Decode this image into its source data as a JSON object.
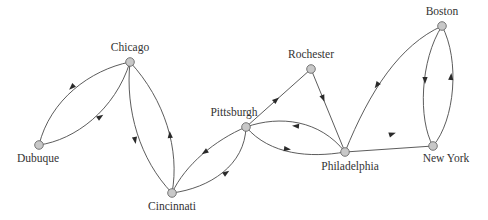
{
  "diagram": {
    "type": "directed-graph",
    "colors": {
      "edge": "#4a4a4a",
      "node_fill": "#c8c8c8",
      "node_stroke": "#6a6a6a",
      "label": "#333333",
      "background": "#ffffff"
    },
    "nodes": [
      {
        "id": "chicago",
        "label": "Chicago",
        "x": 130,
        "y": 62,
        "label_x": 130,
        "label_y": 51,
        "anchor": "middle"
      },
      {
        "id": "dubuque",
        "label": "Dubuque",
        "x": 39,
        "y": 145,
        "label_x": 38,
        "label_y": 162,
        "anchor": "middle"
      },
      {
        "id": "cincinnati",
        "label": "Cincinnati",
        "x": 172,
        "y": 193,
        "label_x": 172,
        "label_y": 210,
        "anchor": "middle"
      },
      {
        "id": "pittsburgh",
        "label": "Pittsburgh",
        "x": 246,
        "y": 127,
        "label_x": 234,
        "label_y": 116,
        "anchor": "middle"
      },
      {
        "id": "rochester",
        "label": "Rochester",
        "x": 311,
        "y": 69,
        "label_x": 311,
        "label_y": 58,
        "anchor": "middle"
      },
      {
        "id": "philadelphia",
        "label": "Philadelphia",
        "x": 345,
        "y": 152,
        "label_x": 350,
        "label_y": 170,
        "anchor": "middle"
      },
      {
        "id": "newyork",
        "label": "New York",
        "x": 433,
        "y": 146,
        "label_x": 446,
        "label_y": 162,
        "anchor": "middle"
      },
      {
        "id": "boston",
        "label": "Boston",
        "x": 442,
        "y": 26,
        "label_x": 442,
        "label_y": 15,
        "anchor": "middle"
      }
    ],
    "edges": [
      {
        "from": "Chicago",
        "to": "Dubuque",
        "path": "M130,62 C90,70 50,100 39,145",
        "arrow": {
          "x": 72,
          "y": 87,
          "angle": 135
        }
      },
      {
        "from": "Dubuque",
        "to": "Chicago",
        "path": "M39,145 C75,140 115,110 130,62",
        "arrow": {
          "x": 100,
          "y": 117,
          "angle": -35
        }
      },
      {
        "from": "Chicago",
        "to": "Cincinnati",
        "path": "M130,62 C125,110 140,160 172,193",
        "arrow": {
          "x": 135,
          "y": 140,
          "angle": 80
        }
      },
      {
        "from": "Cincinnati",
        "to": "Chicago",
        "path": "M172,193 C180,150 165,100 130,62",
        "arrow": {
          "x": 170,
          "y": 135,
          "angle": -95
        }
      },
      {
        "from": "Pittsburgh",
        "to": "Cincinnati",
        "path": "M246,127 C215,140 185,165 172,193",
        "arrow": {
          "x": 205,
          "y": 152,
          "angle": 145
        }
      },
      {
        "from": "Cincinnati",
        "to": "Pittsburgh",
        "path": "M172,193 C210,188 245,165 246,127",
        "arrow": {
          "x": 226,
          "y": 173,
          "angle": -35
        }
      },
      {
        "from": "Pittsburgh",
        "to": "Rochester",
        "path": "M246,127 L311,69",
        "arrow": {
          "x": 276,
          "y": 100,
          "angle": -41
        }
      },
      {
        "from": "Rochester",
        "to": "Philadelphia",
        "path": "M311,69 L345,152",
        "arrow": {
          "x": 323,
          "y": 98,
          "angle": 68
        }
      },
      {
        "from": "Philadelphia",
        "to": "Pittsburgh",
        "path": "M345,152 C320,120 280,115 246,127",
        "arrow": {
          "x": 296,
          "y": 126,
          "angle": 185
        }
      },
      {
        "from": "Pittsburgh",
        "to": "Philadelphia",
        "path": "M246,127 C270,155 310,158 345,152",
        "arrow": {
          "x": 287,
          "y": 149,
          "angle": 8
        }
      },
      {
        "from": "Boston",
        "to": "Philadelphia",
        "path": "M442,26 C400,45 370,90 345,152",
        "arrow": {
          "x": 377,
          "y": 85,
          "angle": 125
        }
      },
      {
        "from": "Philadelphia",
        "to": "NewYork",
        "path": "M345,152 L433,146",
        "arrow": {
          "x": 392,
          "y": 134,
          "angle": -18
        }
      },
      {
        "from": "Boston",
        "to": "NewYork",
        "path": "M442,26 C420,60 418,120 433,146",
        "arrow": {
          "x": 425,
          "y": 80,
          "angle": 90
        }
      },
      {
        "from": "NewYork",
        "to": "Boston",
        "path": "M433,146 C455,120 460,60 442,26",
        "arrow": {
          "x": 451,
          "y": 77,
          "angle": -85
        }
      }
    ]
  }
}
